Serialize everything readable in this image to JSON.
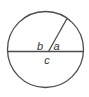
{
  "figure": {
    "labels": {
      "left_angle": "b",
      "right_angle": "a",
      "lower_region": "c"
    },
    "colors": {
      "stroke": "#4d4d4d",
      "label_text": "#333333",
      "background": "#ffffff"
    }
  }
}
